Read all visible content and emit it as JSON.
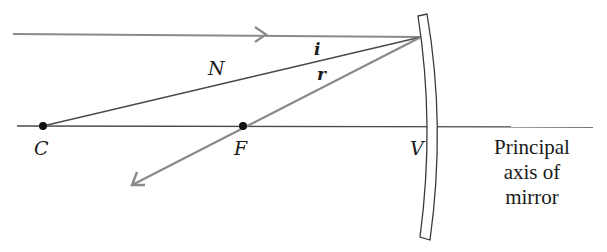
{
  "diagram": {
    "colors": {
      "ray": "#8a8a8a",
      "line": "#4a4a4a",
      "text": "#1a1a1a",
      "background": "#ffffff"
    },
    "labels": {
      "normal": "N",
      "incidence_angle": "i",
      "reflection_angle": "r",
      "center_of_curvature": "C",
      "focal_point": "F",
      "vertex": "V"
    },
    "caption": {
      "line1": "Principal",
      "line2": "axis of",
      "line3": "mirror"
    },
    "points": {
      "C": [
        43,
        126
      ],
      "F": [
        243,
        126
      ],
      "incidence_point": [
        421,
        37
      ]
    }
  }
}
